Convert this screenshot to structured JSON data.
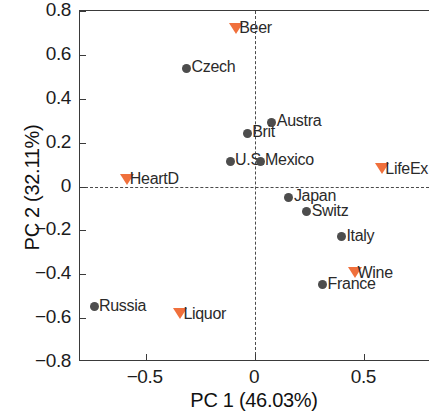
{
  "chart_data": {
    "type": "scatter",
    "title": "",
    "xlabel": "PC 1 (46.03%)",
    "ylabel": "PC 2 (32.11%)",
    "xlim": [
      -0.8,
      0.8
    ],
    "ylim": [
      -0.8,
      0.8
    ],
    "xticks": [
      -0.5,
      0,
      0.5
    ],
    "xtick_labels": [
      "−0.5",
      "0",
      "0.5"
    ],
    "yticks": [
      0.8,
      0.6,
      0.4,
      0.2,
      0,
      -0.2,
      -0.4,
      -0.6,
      -0.8
    ],
    "ytick_labels": [
      "0.8",
      "0.6",
      "0.4",
      "0.2",
      "0",
      "−0.2",
      "−0.4",
      "−0.6",
      "−0.8"
    ],
    "grid": false,
    "legend": "none",
    "reference_lines": {
      "vertical_x": 0,
      "horizontal_y": 0,
      "style": "dashed"
    },
    "colors": {
      "observation": "#4d4d4d",
      "variable": "#f0703c",
      "axis": "#3a3a3a",
      "text": "#1c1c1c"
    },
    "series": [
      {
        "name": "Countries",
        "marker": "circle",
        "color": "#4d4d4d",
        "points": [
          {
            "label": "Czech",
            "x": -0.313,
            "y": 0.539
          },
          {
            "label": "Austra",
            "x": 0.077,
            "y": 0.292
          },
          {
            "label": "Brit",
            "x": -0.036,
            "y": 0.242
          },
          {
            "label": "U.S.",
            "x": -0.114,
            "y": 0.114
          },
          {
            "label": "Mexico",
            "x": 0.023,
            "y": 0.114
          },
          {
            "label": "Japan",
            "x": 0.155,
            "y": -0.05
          },
          {
            "label": "Switz",
            "x": 0.236,
            "y": -0.114
          },
          {
            "label": "Italy",
            "x": 0.395,
            "y": -0.228
          },
          {
            "label": "France",
            "x": 0.309,
            "y": -0.448
          },
          {
            "label": "Russia",
            "x": -0.736,
            "y": -0.548
          }
        ]
      },
      {
        "name": "Variables",
        "marker": "triangle-down",
        "color": "#f0703c",
        "points": [
          {
            "label": "Beer",
            "x": -0.086,
            "y": 0.721
          },
          {
            "label": "HeartD",
            "x": -0.586,
            "y": 0.032
          },
          {
            "label": "LifeEx",
            "x": 0.582,
            "y": 0.082
          },
          {
            "label": "Wine",
            "x": 0.455,
            "y": -0.394
          },
          {
            "label": "Liquor",
            "x": -0.341,
            "y": -0.58
          }
        ]
      }
    ]
  }
}
